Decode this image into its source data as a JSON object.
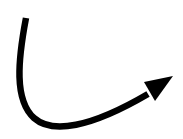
{
  "figure": {
    "icon": "curved-arrow-icon",
    "colors": {
      "background": "#ffffff",
      "stroke": "#000000"
    },
    "stroke_width": 6
  }
}
